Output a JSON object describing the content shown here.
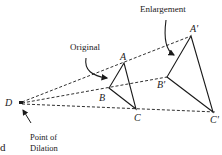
{
  "diagram": {
    "title_label": "Enlargement",
    "original_label": "Original",
    "center_label_line1": "Point of",
    "center_label_line2": "Dilation",
    "center_point_name": "D",
    "fragment_text": "d",
    "original_vertices": {
      "A": "A",
      "B": "B",
      "C": "C"
    },
    "image_vertices": {
      "A": "A'",
      "B": "B'",
      "C": "C'"
    },
    "colors": {
      "ink": "#1a1a1a",
      "background": "#ffffff"
    }
  }
}
